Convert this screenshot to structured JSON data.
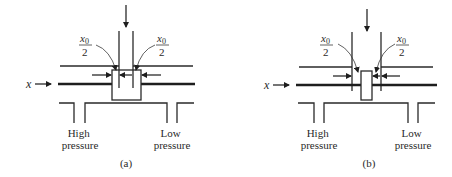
{
  "figure": {
    "panels": [
      {
        "id": "a",
        "caption": "(a)",
        "input_label": "x",
        "opening_label_left": {
          "numerator": "x",
          "subscript": "0",
          "denominator": "2"
        },
        "opening_label_right": {
          "numerator": "x",
          "subscript": "0",
          "denominator": "2"
        },
        "port_left_label": [
          "High",
          "pressure"
        ],
        "port_right_label": [
          "Low",
          "pressure"
        ]
      },
      {
        "id": "b",
        "caption": "(b)",
        "input_label": "x",
        "opening_label_left": {
          "numerator": "x",
          "subscript": "0",
          "denominator": "2"
        },
        "opening_label_right": {
          "numerator": "x",
          "subscript": "0",
          "denominator": "2"
        },
        "port_left_label": [
          "High",
          "pressure"
        ],
        "port_right_label": [
          "Low",
          "pressure"
        ]
      }
    ],
    "colors": {
      "line": "#2a2a2a",
      "background": "#ffffff"
    }
  }
}
